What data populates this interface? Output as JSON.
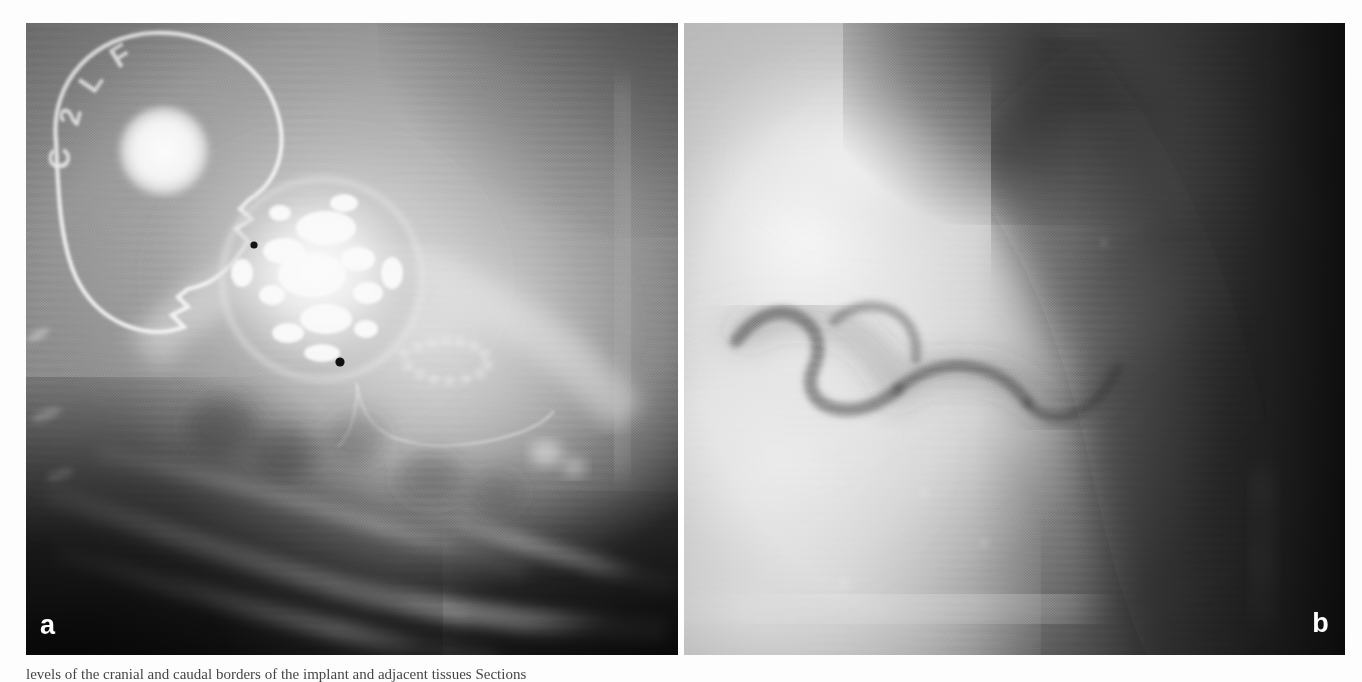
{
  "figure": {
    "kind": "radiograph-figure",
    "panel_count": 2,
    "background_color": "#ffffff",
    "caption_text": "levels of the cranial and caudal borders of the implant and adjacent tissues Sections"
  },
  "panels": [
    {
      "id": "a",
      "label": "a",
      "label_color": "#ffffff",
      "modality": "radiograph",
      "description": "Lateral radiograph showing radiopaque implant mass with surrounding soft tissue and rib shadows",
      "markers": {
        "stamp_letters": "C 2 L F",
        "stamp_note": "curved radiopaque identification lettering on film marker",
        "disc_note": "bright circular radiopaque disc"
      }
    },
    {
      "id": "b",
      "label": "b",
      "label_color": "#ffffff",
      "modality": "radiograph",
      "description": "Magnified radiograph of adjacent region showing serpiginous lucent tract within soft tissue"
    }
  ],
  "labels": {
    "panel_a": "a",
    "panel_b": "b"
  }
}
